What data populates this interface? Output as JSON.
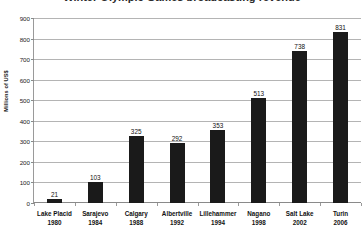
{
  "chart_data": {
    "type": "bar",
    "title": "Winter Olympic Games broadcasting revenue",
    "xlabel": "",
    "ylabel": "Millions of US$",
    "categories": [
      "Lake Placid",
      "Sarajevo",
      "Calgary",
      "Albertville",
      "Lillehammer",
      "Nagano",
      "Salt Lake",
      "Turin"
    ],
    "years": [
      "1980",
      "1984",
      "1988",
      "1992",
      "1994",
      "1998",
      "2002",
      "2006"
    ],
    "values": [
      21,
      103,
      325,
      292,
      353,
      513,
      738,
      831
    ],
    "value_labels": [
      "21",
      "103",
      "325",
      "292",
      "353",
      "513",
      "738",
      "831"
    ],
    "ylim": [
      0,
      900
    ],
    "yticks": [
      0,
      100,
      200,
      300,
      400,
      500,
      600,
      700,
      800,
      900
    ],
    "ytick_labels": [
      "0",
      "100",
      "200",
      "300",
      "400",
      "500",
      "600",
      "700",
      "800",
      "900"
    ],
    "grid": true,
    "legend": false,
    "bar_color": "#1a1a1a",
    "gridline_color": "#b4b4b4",
    "axis_color": "#8a8a8a",
    "background": "#ffffff"
  }
}
